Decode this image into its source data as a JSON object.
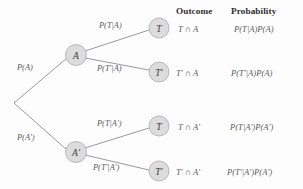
{
  "diagram": {
    "type": "probability-tree",
    "colors": {
      "node_fill": "#dcdcdd",
      "node_stroke": "#a9a9ae",
      "edge": "#8d8d92",
      "text": "#55555a",
      "header_text": "#2d2d2d",
      "background": "#fdfdfd"
    }
  },
  "headers": {
    "outcome": "Outcome",
    "probability": "Probability"
  },
  "nodes": {
    "root": "",
    "a": "A",
    "a_complement": "A'",
    "leaf_t_given_a": "T",
    "leaf_tprime_given_a": "T'",
    "leaf_t_given_aprime": "T",
    "leaf_tprime_given_aprime": "T'"
  },
  "branch_labels": {
    "root_upper": "P(A)",
    "root_lower": "P(A')",
    "a_upper": "P(T|A)",
    "a_lower": "P(T'|A)",
    "aprime_upper": "P(T|A')",
    "aprime_lower": "P(T'|A')"
  },
  "rows": [
    {
      "outcome": "T ∩ A",
      "probability": "P(T|A)P(A)"
    },
    {
      "outcome": "T' ∩ A",
      "probability": "P(T'|A)P(A)"
    },
    {
      "outcome": "T ∩ A'",
      "probability": "P(T|A')P(A')"
    },
    {
      "outcome": "T' ∩ A'",
      "probability": "P(T'|A')P(A')"
    }
  ]
}
